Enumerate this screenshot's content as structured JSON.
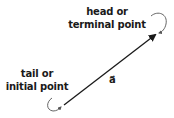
{
  "diagram": {
    "head_label": {
      "line1": "head or",
      "line2": "terminal point"
    },
    "tail_label": {
      "line1": "tail or",
      "line2": "initial point"
    },
    "vector_label": "a",
    "vector_accent": "⃗",
    "colors": {
      "ink": "#1a1a1a",
      "background": "#ffffff",
      "pointer": "#555555"
    }
  }
}
